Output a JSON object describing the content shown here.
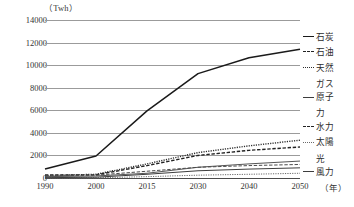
{
  "chart_data": {
    "type": "line",
    "title": "",
    "unit_label": "（Twh）",
    "xlabel": "年",
    "ylabel": "Twh",
    "x": [
      1990,
      2000,
      2015,
      2030,
      2040,
      2050
    ],
    "xtick_labels": [
      "1990",
      "2000",
      "2015",
      "2030",
      "2040",
      "2050"
    ],
    "ylim": [
      0,
      14000
    ],
    "ytick_values": [
      0,
      2000,
      4000,
      6000,
      8000,
      10000,
      12000,
      14000
    ],
    "ytick_labels": [
      "0",
      "2000",
      "4000",
      "6000",
      "8000",
      "10000",
      "12000",
      "14000"
    ],
    "grid": true,
    "legend_position": "right",
    "series": [
      {
        "name": "石炭",
        "key": "coal",
        "style": "solid",
        "width": 1.5,
        "color": "#1a1a1a",
        "values": [
          800,
          1950,
          5950,
          9250,
          10650,
          11400
        ]
      },
      {
        "name": "石油",
        "key": "oil",
        "style": "dashed",
        "width": 1.4,
        "color": "#232323",
        "values": [
          260,
          280,
          1100,
          2000,
          2450,
          2750
        ]
      },
      {
        "name": "天然ガス",
        "key": "natural-gas",
        "style": "dotted",
        "width": 1.4,
        "color": "#2e2e2e",
        "values": [
          200,
          330,
          1250,
          2250,
          2850,
          3350
        ]
      },
      {
        "name": "原子力",
        "key": "nuclear",
        "style": "solid",
        "width": 1.0,
        "color": "#555555",
        "values": [
          120,
          180,
          420,
          950,
          1250,
          1500
        ]
      },
      {
        "name": "水力",
        "key": "hydro",
        "style": "dashed",
        "width": 1.0,
        "color": "#4a4a4a",
        "values": [
          190,
          250,
          600,
          950,
          1100,
          1200
        ]
      },
      {
        "name": "太陽光",
        "key": "solar",
        "style": "dotted",
        "width": 1.0,
        "color": "#6a6a6a",
        "values": [
          10,
          20,
          120,
          250,
          330,
          420
        ]
      },
      {
        "name": "風力",
        "key": "wind",
        "style": "solid",
        "width": 1.0,
        "color": "#3d3d3d",
        "values": [
          30,
          70,
          330,
          640,
          790,
          900
        ]
      }
    ]
  },
  "legend": {
    "items": [
      {
        "label": "石炭",
        "continuation": "",
        "style": "solid-thick"
      },
      {
        "label": "石油",
        "continuation": "",
        "style": "dashed"
      },
      {
        "label": "天然",
        "continuation": "ガス",
        "style": "dotted"
      },
      {
        "label": "原子",
        "continuation": "力",
        "style": "solid-thin"
      },
      {
        "label": "水力",
        "continuation": "",
        "style": "dashed"
      },
      {
        "label": "太陽",
        "continuation": "光",
        "style": "dotted-fine"
      },
      {
        "label": "風力",
        "continuation": "",
        "style": "solid-thin"
      }
    ]
  },
  "colors": {
    "grid": "#9b9b9b",
    "axis": "#4a4a4a",
    "text": "#2b2b2b",
    "background": "#ffffff"
  }
}
